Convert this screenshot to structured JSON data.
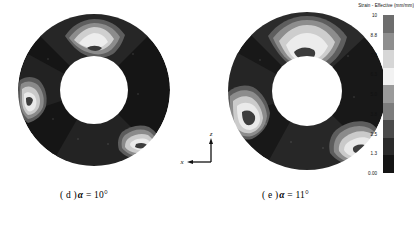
{
  "figure": {
    "background_color": "#ffffff",
    "panels": [
      {
        "id": "d",
        "caption_index": "( d )",
        "caption_symbol": "α",
        "caption_value": "= 10°",
        "caption_full": "( d ) α = 10°"
      },
      {
        "id": "e",
        "caption_index": "( e )",
        "caption_symbol": "α",
        "caption_value": "= 11°",
        "caption_full": "( e ) α = 11°"
      }
    ]
  },
  "axis_triad": {
    "vertical_label": "z",
    "horizontal_label": "x"
  },
  "legend": {
    "title": "Strain - Effective (mm/mm)",
    "orientation": "vertical",
    "ticks": [
      "10",
      "8.8",
      "7.6",
      "6.3",
      "5.0",
      "3.8",
      "2.5",
      "1.3",
      "0.00"
    ]
  },
  "chart_data": {
    "type": "heatmap",
    "title": "Strain - Effective (mm/mm)",
    "subtitle": "Finite element effective strain contours on annular ring cross-sections",
    "xlabel": "x",
    "ylabel": "z",
    "legend_position": "right",
    "grid": false,
    "colormap": "grayscale-banded",
    "value_unit": "mm/mm",
    "vmin": 0.0,
    "vmax": 10.0,
    "tick_values": [
      10,
      8.8,
      7.6,
      6.3,
      5.0,
      3.8,
      2.5,
      1.3,
      0.0
    ],
    "tick_labels": [
      "10",
      "8.8",
      "7.6",
      "6.3",
      "5.0",
      "3.8",
      "2.5",
      "1.3",
      "0.00"
    ],
    "band_colors": [
      "#6d6d6d",
      "#8e8e8e",
      "#d6d6d6",
      "#f2f2f2",
      "#9a9a9a",
      "#7c7c7c",
      "#4a4a4a",
      "#2a2a2a",
      "#141414"
    ],
    "band_ranges": [
      [
        8.8,
        10.0
      ],
      [
        7.6,
        8.8
      ],
      [
        6.3,
        7.6
      ],
      [
        5.0,
        6.3
      ],
      [
        3.8,
        5.0
      ],
      [
        2.5,
        3.8
      ],
      [
        1.3,
        2.5
      ],
      [
        0.0,
        1.3
      ]
    ],
    "series": [
      {
        "name": "( d ) α = 10°",
        "geometry": "annulus",
        "outer_radius_px": 76,
        "inner_radius_px": 34,
        "background_level": 1.0,
        "hot_spots": [
          {
            "location": "top-inner",
            "angle_deg": 90,
            "peak_value": 7.6,
            "extent": "small"
          },
          {
            "location": "left-outer",
            "angle_deg": 190,
            "peak_value": 7.6,
            "extent": "small"
          },
          {
            "location": "lower-right",
            "angle_deg": 320,
            "peak_value": 7.6,
            "extent": "small"
          }
        ]
      },
      {
        "name": "( e ) α = 11°",
        "geometry": "annulus",
        "outer_radius_px": 79,
        "inner_radius_px": 35,
        "background_level": 1.2,
        "hot_spots": [
          {
            "location": "top-inner",
            "angle_deg": 95,
            "peak_value": 8.8,
            "extent": "large"
          },
          {
            "location": "left-lower",
            "angle_deg": 200,
            "peak_value": 8.8,
            "extent": "large"
          },
          {
            "location": "lower-right",
            "angle_deg": 325,
            "peak_value": 8.8,
            "extent": "large"
          }
        ]
      }
    ]
  }
}
